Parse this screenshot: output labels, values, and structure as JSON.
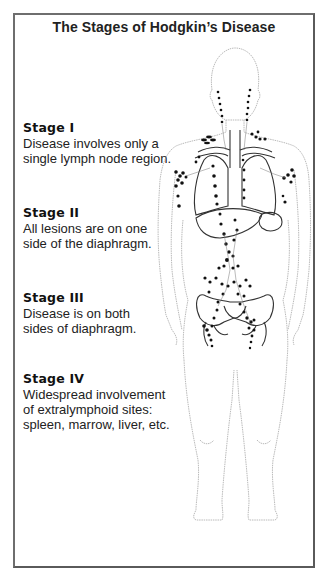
{
  "title": "The Stages of Hodgkin’s Disease",
  "stages": [
    {
      "heading": "Stage I",
      "desc_lines": [
        "Disease involves only a",
        "single lymph node region."
      ]
    },
    {
      "heading": "Stage II",
      "desc_lines": [
        "All lesions are on one",
        "side of the diaphragm."
      ]
    },
    {
      "heading": "Stage III",
      "desc_lines": [
        "Disease is on both",
        "sides of diaphragm."
      ]
    },
    {
      "heading": "Stage IV",
      "desc_lines": [
        "Widespread involvement",
        "of extralymphoid sites:",
        "spleen, marrow, liver, etc."
      ]
    }
  ],
  "figure": {
    "outline_color": "#9a9a9a",
    "organ_color": "#333333",
    "node_color": "#111111"
  }
}
